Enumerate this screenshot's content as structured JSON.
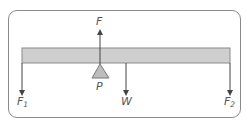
{
  "diagram": {
    "type": "lever-force-diagram",
    "beam": {
      "color": "#cfcfcf",
      "border": "#8a8a8a"
    },
    "fulcrum": {
      "label": "P",
      "color": "#bdbdbd"
    },
    "forces": {
      "up": {
        "label": "F",
        "direction": "up",
        "position": "fulcrum"
      },
      "left_end": {
        "label": "F",
        "subscript": "1",
        "direction": "down",
        "position": "left end"
      },
      "weight": {
        "label": "W",
        "direction": "down",
        "position": "beam centre"
      },
      "right_end": {
        "label": "F",
        "subscript": "2",
        "direction": "down",
        "position": "right end"
      }
    },
    "colors": {
      "line": "#555555",
      "frame": "#8a8a8a"
    }
  }
}
